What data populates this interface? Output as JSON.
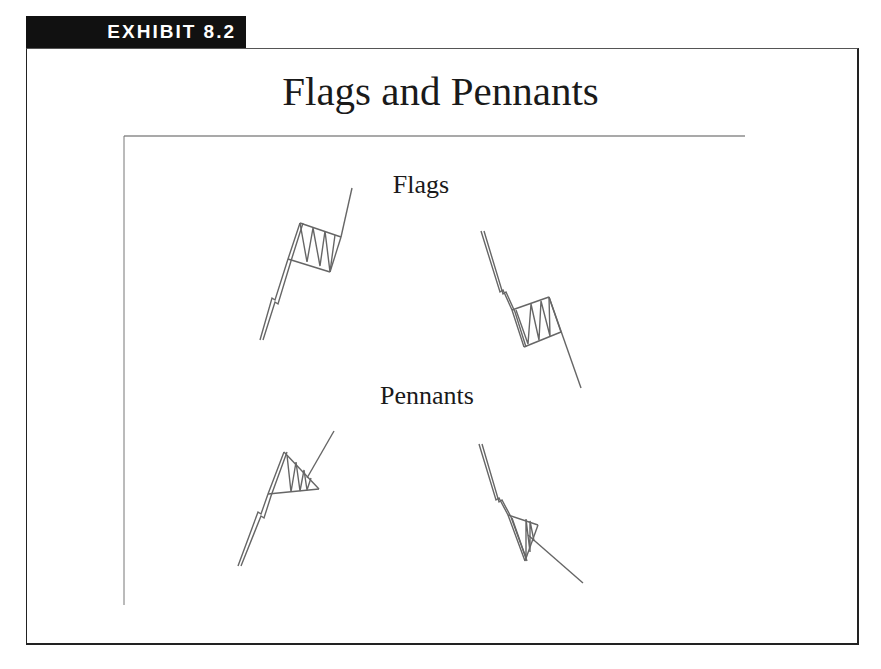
{
  "exhibit": {
    "label": "EXHIBIT 8.2"
  },
  "title": "Flags and Pennants",
  "sections": {
    "flags": {
      "label": "Flags"
    },
    "pennants": {
      "label": "Pennants"
    }
  },
  "patterns": [
    {
      "name": "bull-flag",
      "direction": "up",
      "type": "flag"
    },
    {
      "name": "bear-flag",
      "direction": "down",
      "type": "flag"
    },
    {
      "name": "bull-pennant",
      "direction": "up",
      "type": "pennant"
    },
    {
      "name": "bear-pennant",
      "direction": "down",
      "type": "pennant"
    }
  ],
  "colors": {
    "tab_bg": "#111111",
    "tab_text": "#ffffff",
    "line": "#555555",
    "frame": "#222222"
  }
}
